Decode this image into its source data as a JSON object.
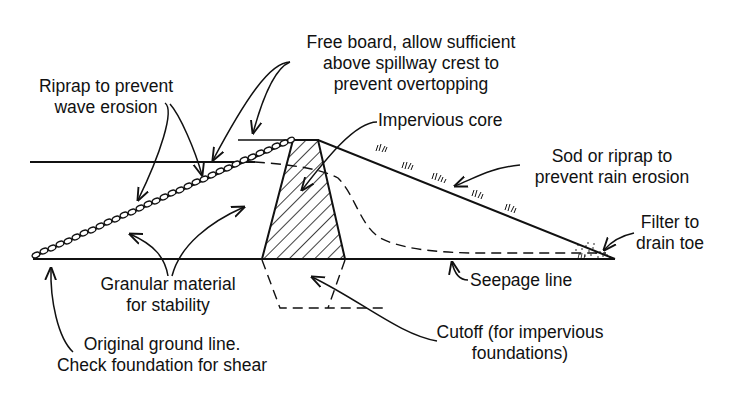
{
  "labels": {
    "freeboard": {
      "lines": [
        "Free board, allow sufficient",
        "above spillway crest to",
        "prevent overtopping"
      ]
    },
    "riprap": {
      "lines": [
        "Riprap to prevent",
        "wave erosion"
      ]
    },
    "core": {
      "lines": [
        "Impervious core"
      ]
    },
    "sod": {
      "lines": [
        "Sod or riprap to",
        "prevent rain erosion"
      ]
    },
    "filter": {
      "lines": [
        "Filter to",
        "drain toe"
      ]
    },
    "granular": {
      "lines": [
        "Granular material",
        "for stability"
      ]
    },
    "seepage": {
      "lines": [
        "Seepage line"
      ]
    },
    "ground": {
      "lines": [
        "Original ground line.",
        "Check foundation for shear"
      ]
    },
    "cutoff": {
      "lines": [
        "Cutoff (for impervious",
        "foundations)"
      ]
    }
  },
  "colors": {
    "ink": "#111111",
    "background": "#ffffff"
  }
}
